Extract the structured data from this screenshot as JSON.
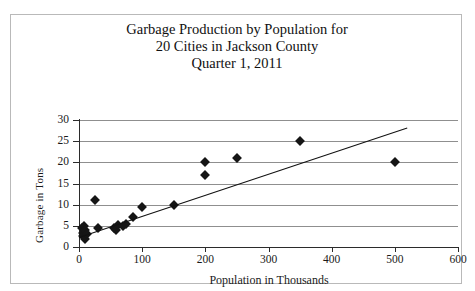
{
  "title_lines": [
    "Garbage Production by Population for",
    "20 Cities in Jackson County",
    "Quarter 1, 2011"
  ],
  "chart_data": {
    "type": "scatter",
    "title": "Garbage Production by Population for 20 Cities in Jackson County Quarter 1, 2011",
    "xlabel": "Population in Thousands",
    "ylabel": "Garbage in Tons",
    "xlim": [
      0,
      600
    ],
    "ylim": [
      0,
      30
    ],
    "xticks": [
      0,
      100,
      200,
      300,
      400,
      500,
      600
    ],
    "yticks": [
      0,
      5,
      10,
      15,
      20,
      25,
      30
    ],
    "grid": "horizontal",
    "legend": "none",
    "marker": "diamond",
    "marker_color": "#151515",
    "points": [
      {
        "x": 5,
        "y": 4.6
      },
      {
        "x": 6,
        "y": 3.4
      },
      {
        "x": 7,
        "y": 2.6
      },
      {
        "x": 8,
        "y": 5.0
      },
      {
        "x": 9,
        "y": 2.0
      },
      {
        "x": 10,
        "y": 4.0
      },
      {
        "x": 12,
        "y": 3.0
      },
      {
        "x": 25,
        "y": 11.0
      },
      {
        "x": 30,
        "y": 4.6
      },
      {
        "x": 55,
        "y": 4.6
      },
      {
        "x": 58,
        "y": 4.0
      },
      {
        "x": 62,
        "y": 5.2
      },
      {
        "x": 70,
        "y": 5.0
      },
      {
        "x": 75,
        "y": 5.4
      },
      {
        "x": 85,
        "y": 7.0
      },
      {
        "x": 100,
        "y": 9.5
      },
      {
        "x": 150,
        "y": 10.0
      },
      {
        "x": 200,
        "y": 20.0
      },
      {
        "x": 200,
        "y": 17.0
      },
      {
        "x": 250,
        "y": 21.0
      },
      {
        "x": 350,
        "y": 25.0
      },
      {
        "x": 500,
        "y": 20.0
      }
    ],
    "trendline": {
      "label": "linear trend",
      "x0": 0,
      "y0": 2.3,
      "x1": 520,
      "y1": 28.2,
      "color": "#111111"
    }
  }
}
